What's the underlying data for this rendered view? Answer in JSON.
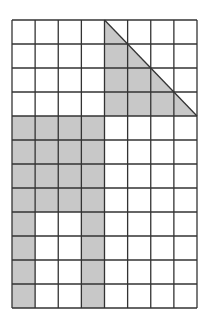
{
  "figure": {
    "type": "grid-shading-diagram",
    "columns": 8,
    "rows": 12,
    "grid": {
      "x0": 12,
      "y0": 20,
      "x1": 197,
      "y1": 308
    },
    "colors": {
      "shade": "#c8c8c8",
      "line": "#333333",
      "background": "#ffffff"
    },
    "shaded_cells": [
      [
        4,
        0
      ],
      [
        5,
        0
      ],
      [
        6,
        0
      ],
      [
        7,
        0
      ],
      [
        0,
        1
      ],
      [
        1,
        1
      ],
      [
        2,
        1
      ],
      [
        3,
        1
      ]
    ],
    "shaded_rects": [
      {
        "name": "block-middle-left",
        "col": 0,
        "row": 4,
        "cols": 4,
        "rows": 4
      },
      {
        "name": "leg-left",
        "col": 0,
        "row": 8,
        "cols": 1,
        "rows": 4
      },
      {
        "name": "leg-right",
        "col": 3,
        "row": 8,
        "cols": 1,
        "rows": 4
      }
    ],
    "shaded_triangles": [
      {
        "name": "top-right-triangle",
        "points": [
          [
            4,
            0
          ],
          [
            4,
            4
          ],
          [
            8,
            4
          ]
        ]
      }
    ]
  }
}
